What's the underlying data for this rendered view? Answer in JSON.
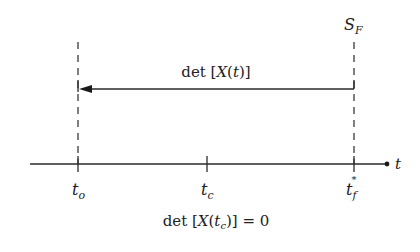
{
  "diagram": {
    "type": "timeline",
    "colors": {
      "stroke": "#2a2a2a",
      "text": "#222222",
      "background": "#ffffff"
    },
    "surface_label": {
      "main": "S",
      "sub": "F"
    },
    "arrow_label": {
      "prefix": "det [",
      "var": "X",
      "open": "(",
      "arg": "t",
      "close": ")]"
    },
    "axis_label": "t",
    "ticks": [
      {
        "id": "t_o",
        "main": "t",
        "sub": "o",
        "sup": ""
      },
      {
        "id": "t_c",
        "main": "t",
        "sub": "c",
        "sup": ""
      },
      {
        "id": "t_f_star",
        "main": "t",
        "sub": "f",
        "sup": "*"
      }
    ],
    "condition_label": {
      "prefix": "det [",
      "var": "X",
      "open": "(",
      "arg": "t",
      "sub": "c",
      "close": ")] = 0"
    }
  }
}
